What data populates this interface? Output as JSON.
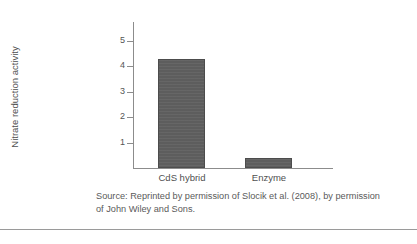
{
  "figure": {
    "caption_line_1": "Source: Reprinted by permission of Slocik et al. (2008), by permission",
    "caption_line_2": "of John Wiley and Sons.",
    "bar_color": "#5d5d5d",
    "axis_color": "#8c8c8c",
    "text_color": "#4f4f4f",
    "rule_color": "#9a9a9a"
  },
  "chart_data": {
    "type": "bar",
    "title": "",
    "xlabel": "",
    "ylabel": "Nitrate reduction activity",
    "categories": [
      "CdS hybrid",
      "Enzyme"
    ],
    "values": [
      4.3,
      0.4
    ],
    "ylim": [
      0,
      5.8
    ],
    "yticks": [
      1,
      2,
      3,
      4,
      5
    ],
    "ytick_labels": [
      "1",
      "2",
      "3",
      "4",
      "5"
    ],
    "grid": false,
    "legend": "none",
    "series": [
      {
        "name": "Nitrate reduction activity",
        "values": [
          4.3,
          0.4
        ]
      }
    ]
  }
}
